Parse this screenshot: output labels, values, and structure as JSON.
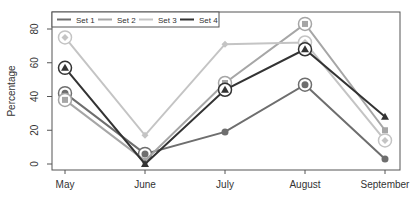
{
  "chart_data": {
    "type": "line",
    "title": "",
    "xlabel": "",
    "ylabel": "Percentage",
    "categories": [
      "May",
      "June",
      "July",
      "August",
      "September"
    ],
    "yticks": [
      0,
      20,
      40,
      60,
      80
    ],
    "ylim": [
      -3,
      89
    ],
    "grid": false,
    "legend_position": "top-left-inside",
    "series": [
      {
        "name": "Set 1",
        "color": "#6e6e6e",
        "marker": "circle",
        "values": [
          42,
          6,
          19,
          47,
          3
        ],
        "circled": [
          true,
          true,
          false,
          true,
          false
        ]
      },
      {
        "name": "Set 2",
        "color": "#a6a6a6",
        "marker": "square",
        "values": [
          38,
          2,
          48,
          83,
          20
        ],
        "circled": [
          true,
          false,
          true,
          true,
          false
        ]
      },
      {
        "name": "Set 3",
        "color": "#c4c4c4",
        "marker": "diamond",
        "values": [
          75,
          17,
          71,
          72,
          14
        ],
        "circled": [
          true,
          false,
          false,
          true,
          true
        ]
      },
      {
        "name": "Set 4",
        "color": "#333333",
        "marker": "triangle",
        "values": [
          57,
          0,
          44,
          68,
          28
        ],
        "circled": [
          true,
          false,
          true,
          true,
          false
        ]
      }
    ]
  }
}
